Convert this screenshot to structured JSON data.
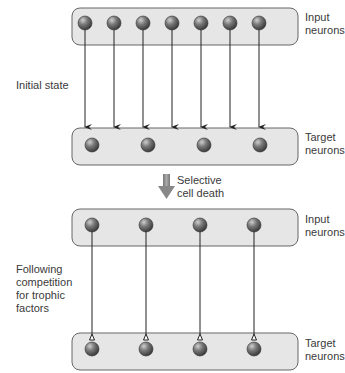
{
  "diagram": {
    "panels": [
      {
        "name": "initial",
        "side_label": "Initial state",
        "input_label": [
          "Input",
          "neurons"
        ],
        "target_label": [
          "Target",
          "neurons"
        ],
        "input_neuron_x": [
          85,
          114,
          143,
          172,
          201,
          230,
          259
        ],
        "target_neuron_x": [
          92,
          148,
          204,
          260
        ],
        "connection": "arrow"
      },
      {
        "name": "after",
        "side_label": [
          "Following",
          "competition",
          "for trophic",
          "factors"
        ],
        "input_label": [
          "Input",
          "neurons"
        ],
        "target_label": [
          "Target",
          "neurons"
        ],
        "input_neuron_x": [
          92,
          146,
          200,
          254
        ],
        "target_neuron_x": [
          92,
          146,
          200,
          254
        ],
        "connection": "synapse"
      }
    ],
    "transition_label": [
      "Selective",
      "cell death"
    ],
    "colors": {
      "box_fill": "#e6e6e6",
      "box_stroke": "#555555",
      "neuron": "#6a6a6a",
      "line": "#222222",
      "transition_arrow": "#888888"
    }
  }
}
